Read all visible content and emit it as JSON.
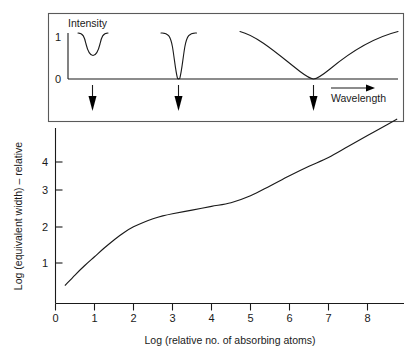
{
  "figure": {
    "kind": "curve-of-growth",
    "background_color": "#ffffff",
    "line_color": "#1a1a1a"
  },
  "top_panel": {
    "name": "spectral-line-profile-panel",
    "y_axis_label": "Intensity",
    "y_ticks": [
      "1",
      "0"
    ],
    "x_axis_label": "Wavelength",
    "x_axis_direction_icon": "right-arrow-icon",
    "marker_icon": "down-arrow-icon",
    "markers": [
      {
        "label": "weak-unsaturated-line",
        "log_n": 1.0
      },
      {
        "label": "saturated-line",
        "log_n": 3.2
      },
      {
        "label": "damping-wings-line",
        "log_n": 6.6
      }
    ],
    "profiles": [
      {
        "name": "weak-line-profile",
        "depth": 0.45,
        "width": "narrow"
      },
      {
        "name": "saturated-line-profile",
        "depth": 1.0,
        "width": "narrow"
      },
      {
        "name": "damped-line-profile",
        "depth": 1.0,
        "width": "broad"
      }
    ]
  },
  "chart_data": {
    "type": "line",
    "title": "",
    "xlabel": "Log (relative no. of absorbing atoms)",
    "ylabel": "Log (equivalent width) – relative",
    "xlim": [
      0,
      9
    ],
    "ylim": [
      0,
      5.4
    ],
    "xticks": [
      0,
      1,
      2,
      3,
      4,
      5,
      6,
      7,
      8
    ],
    "xticklabels": [
      "0",
      "1",
      "2",
      "3",
      "4",
      "5",
      "6",
      "7",
      "8"
    ],
    "yticks": [
      1,
      2,
      3,
      4
    ],
    "yticklabels": [
      "1",
      "2",
      "3",
      "4"
    ],
    "grid": false,
    "legend": null,
    "series": [
      {
        "name": "curve-of-growth",
        "x": [
          0.25,
          0.5,
          0.75,
          1.0,
          1.25,
          1.5,
          1.75,
          2.0,
          2.25,
          2.5,
          2.75,
          3.0,
          3.5,
          4.0,
          4.5,
          5.0,
          5.5,
          6.0,
          6.5,
          7.0,
          7.5,
          8.0,
          8.5,
          8.75
        ],
        "y": [
          0.5,
          0.78,
          1.04,
          1.28,
          1.52,
          1.74,
          1.94,
          2.1,
          2.22,
          2.32,
          2.4,
          2.46,
          2.56,
          2.66,
          2.76,
          2.95,
          3.22,
          3.5,
          3.76,
          4.0,
          4.3,
          4.6,
          4.9,
          5.05
        ]
      }
    ],
    "annotations": [
      {
        "region": "linear-part",
        "x_range": [
          0.25,
          2.0
        ]
      },
      {
        "region": "flat-saturated-part",
        "x_range": [
          2.0,
          4.5
        ]
      },
      {
        "region": "damping-part",
        "x_range": [
          4.5,
          8.75
        ]
      }
    ]
  }
}
